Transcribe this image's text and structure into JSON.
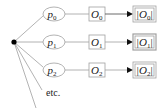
{
  "diagram": {
    "root": {
      "label": ""
    },
    "branches": [
      {
        "p": "p",
        "p_sub": "0",
        "o": "O",
        "o_sub": "0",
        "norm": "|O",
        "norm_sub": "0",
        "norm_end": "|"
      },
      {
        "p": "p",
        "p_sub": "1",
        "o": "O",
        "o_sub": "1",
        "norm": "|O",
        "norm_sub": "1",
        "norm_end": "|"
      },
      {
        "p": "p",
        "p_sub": "2",
        "o": "O",
        "o_sub": "2",
        "norm": "|O",
        "norm_sub": "2",
        "norm_end": "|"
      }
    ],
    "etc_label": "etc.",
    "colors": {
      "line": "#9a9a9a",
      "node_stroke": "#9a9a9a",
      "dot": "#000000",
      "arrow": "#111111"
    }
  }
}
